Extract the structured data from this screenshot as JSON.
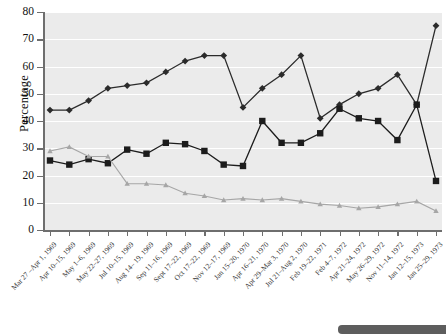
{
  "chart_data": {
    "type": "line",
    "title": "",
    "xlabel": "",
    "ylabel": "Percentage",
    "ylim": [
      0,
      80
    ],
    "yticks": [
      0,
      10,
      20,
      30,
      40,
      50,
      60,
      70,
      80
    ],
    "grid": true,
    "legend_position": "none",
    "categories": [
      "Mar 27 –Apr 1, 1969",
      "Apr 10–15, 1969",
      "May 1–6, 1969",
      "May 22–27, 1969",
      "Jul 10–15, 1969",
      "Aug 14– 19, 1969",
      "Sep 11–16, 1969",
      "Sept 17–22, 1969",
      "Oct 17–22, 1969",
      "Nov 12–17, 1969",
      "Jan 15–20, 1970",
      "Apr 16–21, 1970",
      "Apr 29–Mar 3, 1970",
      "Jul 21–Aug 2, 1970",
      "Feb 19–22, 1971",
      "Feb 4–7, 1972",
      "Apr 21–24, 1972",
      "May 26–29, 1972",
      "Nov 11–14, 1972",
      "Jan 12–15, 1973",
      "Jan 25–29, 1973"
    ],
    "series": [
      {
        "name": "series-diamond-dark",
        "marker": "diamond",
        "color": "#2b2b2b",
        "values": [
          44,
          44,
          47.5,
          52,
          53,
          54,
          58,
          62,
          64,
          64,
          45,
          52,
          57,
          64,
          41,
          46,
          50,
          52,
          57,
          46,
          75
        ]
      },
      {
        "name": "series-square-dark",
        "marker": "square",
        "color": "#1c1c1c",
        "values": [
          25.5,
          24,
          26,
          24.5,
          29.5,
          28,
          32,
          31.5,
          29,
          24,
          23.5,
          40,
          32,
          32,
          35.5,
          44.5,
          41,
          40,
          33,
          46,
          18
        ]
      },
      {
        "name": "series-triangle-gray",
        "marker": "triangle",
        "color": "#a6a6a6",
        "values": [
          29,
          30.5,
          27,
          27,
          17,
          17,
          16.5,
          13.5,
          12.5,
          11,
          11.5,
          11,
          11.5,
          10.5,
          9.5,
          9,
          8,
          8.5,
          9.5,
          10.5,
          7
        ]
      }
    ]
  }
}
